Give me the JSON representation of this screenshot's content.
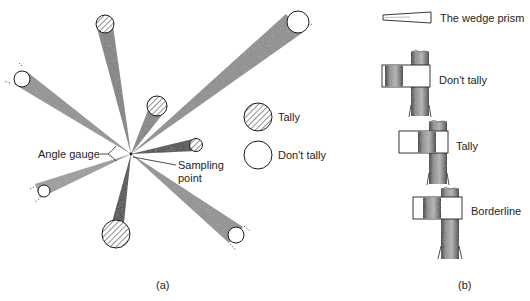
{
  "panel_a": {
    "caption": "(a)",
    "labels": {
      "angle_gauge": "Angle gauge",
      "sampling_point_line1": "Sampling",
      "sampling_point_line2": "point"
    },
    "legend": [
      {
        "key": "tally",
        "label": "Tally",
        "symbol": "hatched-circle"
      },
      {
        "key": "dont_tally",
        "label": "Don't tally",
        "symbol": "open-circle"
      }
    ],
    "sampling_point": {
      "x": 131,
      "y": 154
    },
    "trees": [
      {
        "id": "t1",
        "x": 105,
        "y": 24,
        "r": 9,
        "status": "tally"
      },
      {
        "id": "t2",
        "x": 22,
        "y": 79,
        "r": 8,
        "status": "dont_tally"
      },
      {
        "id": "t3",
        "x": 157,
        "y": 106,
        "r": 10,
        "status": "tally"
      },
      {
        "id": "t4",
        "x": 298,
        "y": 22,
        "r": 11,
        "status": "dont_tally"
      },
      {
        "id": "t5",
        "x": 196,
        "y": 145,
        "r": 6,
        "status": "tally"
      },
      {
        "id": "t6",
        "x": 44,
        "y": 191,
        "r": 6,
        "status": "dont_tally"
      },
      {
        "id": "t7",
        "x": 116,
        "y": 234,
        "r": 14,
        "status": "tally"
      },
      {
        "id": "t8",
        "x": 236,
        "y": 235,
        "r": 8,
        "status": "dont_tally"
      }
    ]
  },
  "panel_b": {
    "caption": "(b)",
    "wedge_prism_label": "The wedge prism",
    "views": [
      {
        "key": "dont_tally",
        "label": "Don't tally"
      },
      {
        "key": "tally",
        "label": "Tally"
      },
      {
        "key": "borderline",
        "label": "Borderline"
      }
    ]
  },
  "colors": {
    "beam": "#8c8c8c",
    "beam_dark": "#555555",
    "stroke": "#1a1a1a",
    "bark": "#6e6e6e"
  }
}
